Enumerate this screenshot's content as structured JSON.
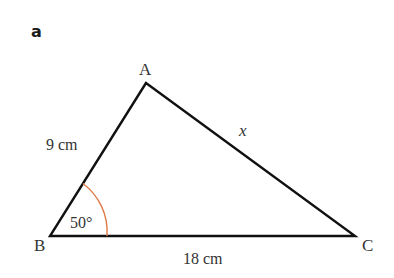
{
  "part_label": "a",
  "triangle": {
    "vertices": {
      "A": {
        "label": "A",
        "x": 146,
        "y": 83
      },
      "B": {
        "label": "B",
        "x": 50,
        "y": 236
      },
      "C": {
        "label": "C",
        "x": 355,
        "y": 236
      }
    },
    "sides": {
      "AB": {
        "label": "9 cm"
      },
      "BC": {
        "label": "18 cm"
      },
      "AC": {
        "label": "x"
      }
    },
    "angle_B": {
      "label": "50°",
      "color": "#e07b4a"
    },
    "line_color": "#111111"
  }
}
